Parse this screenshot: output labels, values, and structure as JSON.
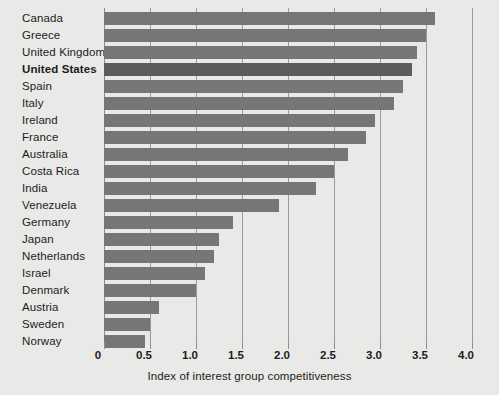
{
  "chart_data": {
    "type": "bar",
    "orientation": "horizontal",
    "title": "",
    "xlabel": "Index of interest group competitiveness",
    "ylabel": "",
    "xlim": [
      0,
      4.0
    ],
    "xticks": [
      "0",
      "0.5",
      "1.0",
      "1.5",
      "2.0",
      "2.5",
      "3.0",
      "3.5",
      "4.0"
    ],
    "xtick_values": [
      0,
      0.5,
      1.0,
      1.5,
      2.0,
      2.5,
      3.0,
      3.5,
      4.0
    ],
    "grid": "vertical",
    "legend": "none",
    "categories": [
      "Canada",
      "Greece",
      "United Kingdom",
      "United States",
      "Spain",
      "Italy",
      "Ireland",
      "France",
      "Australia",
      "Costa Rica",
      "India",
      "Venezuela",
      "Germany",
      "Japan",
      "Netherlands",
      "Israel",
      "Denmark",
      "Austria",
      "Sweden",
      "Norway"
    ],
    "values": [
      3.6,
      3.5,
      3.4,
      3.35,
      3.25,
      3.15,
      2.95,
      2.85,
      2.65,
      2.5,
      2.3,
      1.9,
      1.4,
      1.25,
      1.2,
      1.1,
      1.0,
      0.6,
      0.5,
      0.45
    ],
    "highlighted_category": "United States",
    "bar_color": "#767676",
    "highlight_bar_color": "#5c5c5c",
    "background_color": "#e9e9e7",
    "gridline_color": "#9a9a98"
  }
}
